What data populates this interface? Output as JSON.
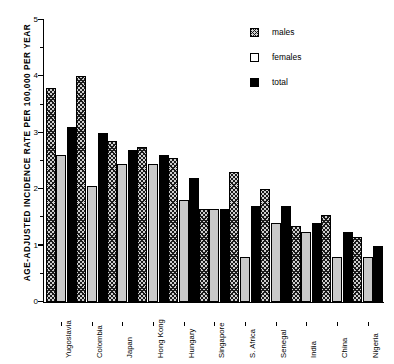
{
  "chart_data": {
    "type": "bar",
    "title": "",
    "xlabel": "",
    "ylabel": "AGE-ADJUSTED INCIDENCE RATE PER 100,000 PER YEAR",
    "ylim": [
      0,
      5
    ],
    "ytick_labels": [
      "0",
      "1",
      "2",
      "3",
      "4",
      "5"
    ],
    "ytick_values": [
      0,
      1,
      2,
      3,
      4,
      5
    ],
    "yminor_values": [
      0.5,
      1.5,
      2.5,
      3.5,
      4.5
    ],
    "grid": false,
    "legend_position": "top-right",
    "categories": [
      "Yugoslavia",
      "Colombia",
      "Japan",
      "Hong Kong",
      "Hungary",
      "Singapore",
      "S. Africa",
      "Senegal",
      "India",
      "China",
      "Nigeria"
    ],
    "series": [
      {
        "name": "males",
        "style": "hatched",
        "values": [
          3.8,
          4.0,
          2.85,
          2.75,
          2.55,
          1.65,
          2.3,
          2.0,
          1.35,
          1.55,
          1.15
        ]
      },
      {
        "name": "females",
        "style": "open",
        "values": [
          2.6,
          2.05,
          2.45,
          2.45,
          1.8,
          1.65,
          0.8,
          1.4,
          1.25,
          0.8,
          0.8
        ]
      },
      {
        "name": "total",
        "style": "solid",
        "values": [
          3.1,
          3.0,
          2.7,
          2.6,
          2.2,
          1.65,
          1.7,
          1.7,
          1.4,
          1.25,
          1.0
        ]
      }
    ]
  },
  "legend": {
    "items": [
      {
        "label": "males"
      },
      {
        "label": "females"
      },
      {
        "label": "total"
      }
    ]
  },
  "colors": {
    "axis": "#000000",
    "males_fill": "#cfcfcf",
    "females_fill": "#c9c9c9",
    "total_fill": "#000000"
  }
}
